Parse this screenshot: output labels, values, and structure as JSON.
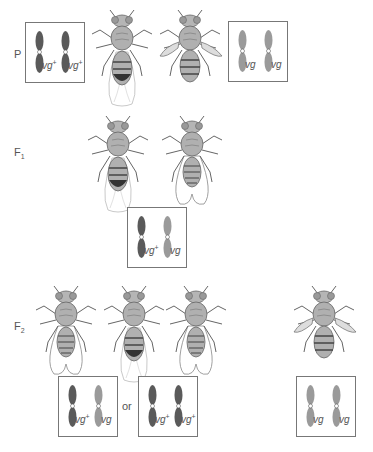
{
  "generations": {
    "P": {
      "label": "P",
      "sub": ""
    },
    "F1": {
      "label": "F",
      "sub": "1"
    },
    "F2": {
      "label": "F",
      "sub": "2"
    }
  },
  "boxes": {
    "p_left": {
      "alleles": [
        {
          "base": "vg",
          "sup": "+"
        },
        {
          "base": "vg",
          "sup": "+"
        }
      ],
      "shades": [
        "dark",
        "dark"
      ]
    },
    "p_right": {
      "alleles": [
        {
          "base": "vg",
          "sup": ""
        },
        {
          "base": "vg",
          "sup": ""
        }
      ],
      "shades": [
        "light",
        "light"
      ]
    },
    "f1": {
      "alleles": [
        {
          "base": "vg",
          "sup": "+"
        },
        {
          "base": "vg",
          "sup": ""
        }
      ],
      "shades": [
        "dark",
        "light"
      ]
    },
    "f2_a": {
      "alleles": [
        {
          "base": "vg",
          "sup": "+"
        },
        {
          "base": "vg",
          "sup": ""
        }
      ],
      "shades": [
        "dark",
        "light"
      ]
    },
    "f2_b": {
      "alleles": [
        {
          "base": "vg",
          "sup": "+"
        },
        {
          "base": "vg",
          "sup": "+"
        }
      ],
      "shades": [
        "dark",
        "dark"
      ]
    },
    "f2_c": {
      "alleles": [
        {
          "base": "vg",
          "sup": ""
        },
        {
          "base": "vg",
          "sup": ""
        }
      ],
      "shades": [
        "light",
        "light"
      ]
    }
  },
  "connector": {
    "or_label": "or"
  },
  "flies": {
    "p_wild": {
      "phenotype": "wild-type wings",
      "sex": "female"
    },
    "p_vestigial": {
      "phenotype": "vestigial wings",
      "sex": "male"
    },
    "f1_1": {
      "phenotype": "wild-type wings",
      "sex": "female"
    },
    "f1_2": {
      "phenotype": "wild-type wings",
      "sex": "male"
    },
    "f2_1": {
      "phenotype": "wild-type wings",
      "sex": "male"
    },
    "f2_2": {
      "phenotype": "wild-type wings",
      "sex": "female"
    },
    "f2_3": {
      "phenotype": "wild-type wings",
      "sex": "male"
    },
    "f2_4": {
      "phenotype": "vestigial wings",
      "sex": "male"
    }
  },
  "colors": {
    "chrom_dark": "#5a5a5a",
    "chrom_light": "#9a9a9a",
    "box_border": "#777777",
    "fly_body": "#b0b0b0",
    "fly_line": "#555555"
  }
}
